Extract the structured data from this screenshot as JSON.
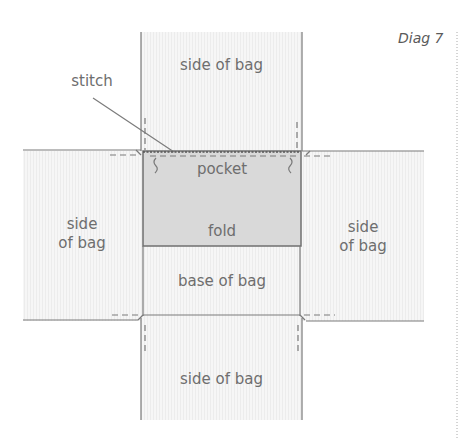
{
  "diagram": {
    "title": "Diag 7",
    "labels": {
      "top": "side of bag",
      "stitch": "stitch",
      "pocket": "pocket",
      "fold": "fold",
      "left_line1": "side",
      "left_line2": "of bag",
      "right_line1": "side",
      "right_line2": "of bag",
      "base": "base of bag",
      "bottom": "side of bag"
    },
    "colors": {
      "panel_fill": "#f4f4f4",
      "pocket_fill": "#d9d9d9",
      "line": "#777777",
      "text": "#6e6e6e"
    }
  }
}
